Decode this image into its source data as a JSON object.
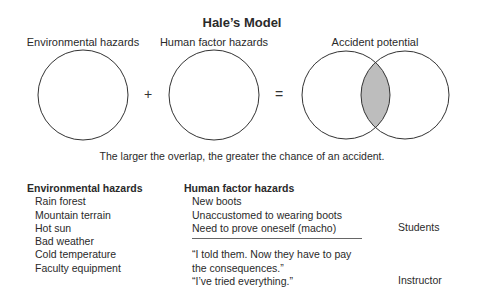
{
  "title": "Hale’s Model",
  "diagram": {
    "labels": {
      "left": "Environmental hazards",
      "middle": "Human factor hazards",
      "right": "Accident potential"
    },
    "operators": {
      "plus": "+",
      "equals": "="
    },
    "overlap_fill": "#bdbdbd",
    "stroke": "#333333"
  },
  "caption": "The larger the overlap, the greater the chance of an accident.",
  "environmental": {
    "header": "Environmental hazards",
    "items": [
      "Rain forest",
      "Mountain terrain",
      "Hot sun",
      "Bad weather",
      "Cold temperature",
      "Faculty equipment"
    ]
  },
  "human": {
    "header": "Human factor hazards",
    "students_items": [
      "New boots",
      "Unaccustomed to wearing boots",
      "Need to prove oneself (macho)"
    ],
    "instructor_items": [
      "“I told them. Now they have to pay",
      "the consequences.”",
      "“I’ve tried everything.”"
    ]
  },
  "roles": {
    "students": "Students",
    "instructor": "Instructor"
  }
}
